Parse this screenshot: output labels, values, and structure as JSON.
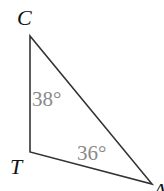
{
  "diagram": {
    "type": "triangle",
    "vertices": [
      {
        "name": "C",
        "x": 30,
        "y": 36
      },
      {
        "name": "T",
        "x": 30,
        "y": 152
      },
      {
        "name": "A",
        "x": 152,
        "y": 184
      }
    ],
    "angles": [
      {
        "vertex": "C",
        "label": "38°"
      },
      {
        "vertex": "A",
        "label": "36°"
      }
    ],
    "colors": {
      "stroke": "#333333",
      "vertex_label": "#111111",
      "angle_label": "#8a8a8a"
    }
  }
}
